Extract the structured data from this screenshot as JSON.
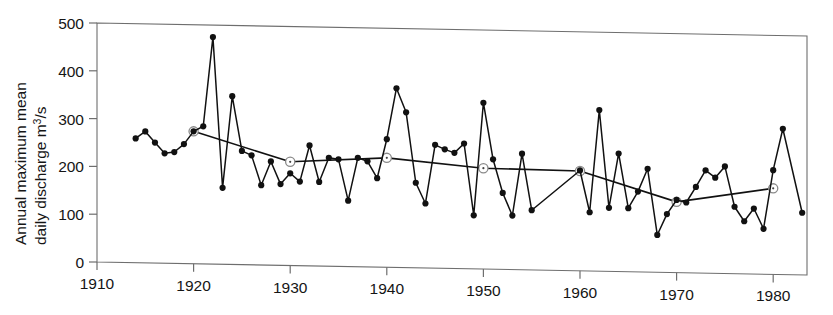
{
  "chart_data": {
    "type": "line",
    "title": "",
    "xlabel": "",
    "ylabel": "Annual maximum mean daily discharge m3/s",
    "ylabel_line1": "Annual maximum mean",
    "ylabel_line2_a": "daily discharge m",
    "ylabel_line2_sup": "3",
    "ylabel_line2_b": "/s",
    "xlim": [
      1910,
      1983.5
    ],
    "ylim": [
      0,
      500
    ],
    "grid": false,
    "legend": "none",
    "xticks": [
      1910,
      1920,
      1930,
      1940,
      1950,
      1960,
      1970,
      1980
    ],
    "xtick_labels": [
      "1910",
      "1920",
      "1930",
      "1940",
      "1950",
      "1960",
      "1970",
      "1980"
    ],
    "yticks": [
      0,
      100,
      200,
      300,
      400,
      500
    ],
    "ytick_labels": [
      "0",
      "100",
      "200",
      "300",
      "400",
      "500"
    ],
    "series": [
      {
        "name": "Annual maximum mean daily discharge",
        "marker": "filled-circle",
        "color": "#111111",
        "x": [
          1914,
          1915,
          1916,
          1917,
          1918,
          1919,
          1920,
          1921,
          1922,
          1923,
          1924,
          1925,
          1926,
          1927,
          1928,
          1929,
          1930,
          1931,
          1932,
          1933,
          1934,
          1935,
          1936,
          1937,
          1938,
          1939,
          1940,
          1941,
          1942,
          1943,
          1944,
          1945,
          1946,
          1947,
          1948,
          1949,
          1950,
          1951,
          1952,
          1953,
          1954,
          1955,
          1960,
          1961,
          1962,
          1963,
          1964,
          1965,
          1966,
          1967,
          1968,
          1969,
          1970,
          1971,
          1972,
          1973,
          1974,
          1975,
          1976,
          1977,
          1978,
          1979,
          1980,
          1981,
          1983
        ],
        "values": [
          260,
          275,
          252,
          230,
          233,
          250,
          277,
          288,
          475,
          160,
          352,
          238,
          229,
          167,
          217,
          170,
          193,
          176,
          252,
          176,
          227,
          224,
          138,
          228,
          221,
          186,
          268,
          375,
          325,
          178,
          135,
          258,
          249,
          242,
          262,
          112,
          348,
          230,
          160,
          113,
          243,
          125,
          210,
          123,
          337,
          133,
          247,
          133,
          168,
          216,
          78,
          122,
          152,
          147,
          180,
          215,
          200,
          224,
          140,
          110,
          137,
          95,
          218,
          305,
          130
        ]
      },
      {
        "name": "Decadal trend line",
        "marker": "open-circle",
        "color": "#111111",
        "x": [
          1920,
          1930,
          1940,
          1950,
          1960,
          1970,
          1980
        ],
        "values": [
          277,
          217,
          229,
          211,
          209,
          148,
          180
        ]
      }
    ]
  }
}
